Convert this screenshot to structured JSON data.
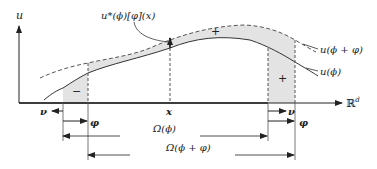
{
  "diagram": {
    "axes": {
      "y_label": "u",
      "x_label": "ℝ",
      "x_label_sup": "d"
    },
    "curves": {
      "base_label": "u(ϕ)",
      "perturbed_label": "u(ϕ + φ)",
      "derivative_label": "u*(ϕ)[φ](x)"
    },
    "points": {
      "x_label": "x"
    },
    "region_signs": {
      "left": "−",
      "middle": "+",
      "right": "+"
    },
    "arrows": {
      "nu_left": "ν",
      "phi_left": "φ",
      "nu_right": "ν",
      "phi_right": "φ"
    },
    "domains": {
      "omega_phi": "Ω(ϕ)",
      "omega_phi_plus": "Ω(ϕ + φ)"
    },
    "colors": {
      "fill": "#e3e3e3",
      "line": "#333333",
      "dashed": "#555555"
    }
  }
}
